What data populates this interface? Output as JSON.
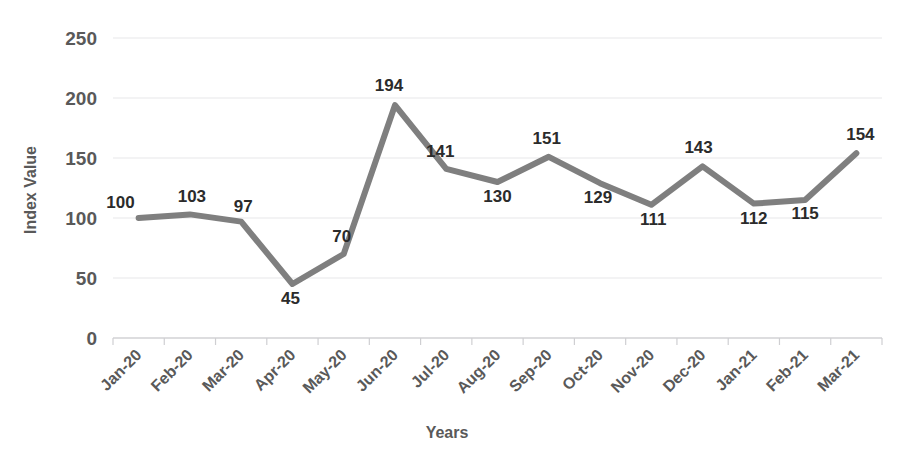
{
  "chart_data": {
    "type": "line",
    "title": "",
    "subtitle": "",
    "xlabel": "Years",
    "ylabel": "Index Value",
    "categories": [
      "Jan-20",
      "Feb-20",
      "Mar-20",
      "Apr-20",
      "May-20",
      "Jun-20",
      "Jul-20",
      "Aug-20",
      "Sep-20",
      "Oct-20",
      "Nov-20",
      "Dec-20",
      "Jan-21",
      "Feb-21",
      "Mar-21"
    ],
    "values": [
      100,
      103,
      97,
      45,
      70,
      194,
      141,
      130,
      151,
      129,
      111,
      143,
      112,
      115,
      154
    ],
    "data_labels": [
      "100",
      "103",
      "97",
      "45",
      "70",
      "194",
      "141",
      "130",
      "151",
      "129",
      "111",
      "143",
      "112",
      "115",
      "154"
    ],
    "ylim": [
      0,
      250
    ],
    "ytick_labels": [
      "0",
      "50",
      "100",
      "150",
      "200",
      "250"
    ],
    "ytick_values": [
      0,
      50,
      100,
      150,
      200,
      250
    ],
    "grid": true,
    "legend": "none",
    "series_color": "#7f7f7f",
    "gridline_color": "#e8e8ea",
    "axis_text_color": "#595959",
    "data_label_color": "#2b2b2b",
    "background_color": "#ffffff",
    "line_width": 6,
    "xtick_rotation": -45
  }
}
